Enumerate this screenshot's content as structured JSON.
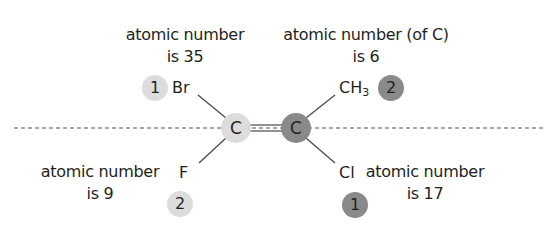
{
  "colors": {
    "light_circle": "#dcdcdc",
    "dark_circle": "#8a8a8a",
    "bond_line": "#4a4a4a",
    "dashed_line": "#8c8c8c",
    "text": "#231f20"
  },
  "labels": {
    "top_left": {
      "line1": "atomic number",
      "line2": "is 35"
    },
    "top_right": {
      "line1": "atomic number (of C)",
      "line2": "is 6"
    },
    "bottom_left": {
      "line1": "atomic number",
      "line2": "is 9"
    },
    "bottom_right": {
      "line1": "atomic number",
      "line2": "is 17"
    }
  },
  "substituents": {
    "top_left": {
      "symbol": "Br",
      "priority": "1",
      "priority_shade": "light"
    },
    "top_right": {
      "symbol": "CH",
      "subscript": "3",
      "priority": "2",
      "priority_shade": "dark"
    },
    "bottom_left": {
      "symbol": "F",
      "priority": "2",
      "priority_shade": "light"
    },
    "bottom_right": {
      "symbol": "Cl",
      "priority": "1",
      "priority_shade": "dark"
    }
  },
  "carbons": {
    "left": {
      "symbol": "C",
      "shade": "light"
    },
    "right": {
      "symbol": "C",
      "shade": "dark"
    }
  },
  "bond": {
    "type": "double"
  },
  "reference_line": {
    "style": "dashed"
  }
}
